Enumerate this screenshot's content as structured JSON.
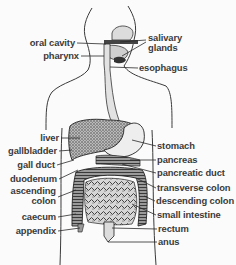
{
  "diagram": {
    "labels_left": [
      {
        "id": "oral-cavity",
        "text": "oral cavity"
      },
      {
        "id": "pharynx",
        "text": "pharynx"
      },
      {
        "id": "liver",
        "text": "liver"
      },
      {
        "id": "gallbladder",
        "text": "gallbladder"
      },
      {
        "id": "gall-duct",
        "text": "gall duct"
      },
      {
        "id": "duodenum",
        "text": "duodenum"
      },
      {
        "id": "ascending-colon",
        "text": "ascending",
        "text2": "colon"
      },
      {
        "id": "caecum",
        "text": "caecum"
      },
      {
        "id": "appendix",
        "text": "appendix"
      }
    ],
    "labels_right": [
      {
        "id": "salivary-glands",
        "text": "salivary",
        "text2": "glands"
      },
      {
        "id": "esophagus",
        "text": "esophagus"
      },
      {
        "id": "stomach",
        "text": "stomach"
      },
      {
        "id": "pancreas",
        "text": "pancreas"
      },
      {
        "id": "pancreatic-duct",
        "text": "pancreatic duct"
      },
      {
        "id": "transverse-colon",
        "text": "transverse colon"
      },
      {
        "id": "descending-colon",
        "text": "descending colon"
      },
      {
        "id": "small-intestine",
        "text": "small intestine"
      },
      {
        "id": "rectum",
        "text": "rectum"
      },
      {
        "id": "anus",
        "text": "anus"
      }
    ],
    "colors": {
      "line": "#2a2a2a",
      "text": "#3a3a3a",
      "organ_fill_dark": "#555555",
      "organ_fill_light": "#e8e8e8",
      "background": "#fbfbfb"
    }
  }
}
